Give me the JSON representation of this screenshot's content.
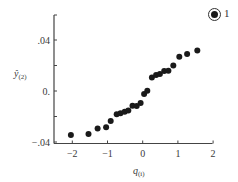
{
  "chart_data": {
    "type": "scatter",
    "title": "",
    "xlabel": "q_(i)",
    "ylabel": "ŷ_(2)",
    "xlim": [
      -2.5,
      2
    ],
    "ylim": [
      -0.04,
      0.06
    ],
    "x_ticks": [
      -2,
      -1,
      0,
      1,
      2
    ],
    "x_tick_labels": [
      "−2",
      "−1",
      "0",
      "1",
      "2"
    ],
    "y_ticks": [
      -0.04,
      -0.02,
      0,
      0.02,
      0.04
    ],
    "y_tick_labels": [
      "−.04",
      "",
      "0.",
      "",
      ".04"
    ],
    "grid": false,
    "legend": null,
    "annotation": "1",
    "series": [
      {
        "name": "residuals",
        "color": "#1a1a1a",
        "points": [
          {
            "x": -2.04,
            "y": -0.0345
          },
          {
            "x": -1.54,
            "y": -0.0337
          },
          {
            "x": -1.28,
            "y": -0.0295
          },
          {
            "x": -1.04,
            "y": -0.0285
          },
          {
            "x": -0.91,
            "y": -0.0235
          },
          {
            "x": -0.74,
            "y": -0.0183
          },
          {
            "x": -0.63,
            "y": -0.0175
          },
          {
            "x": -0.51,
            "y": -0.0162
          },
          {
            "x": -0.41,
            "y": -0.0154
          },
          {
            "x": -0.29,
            "y": -0.0115
          },
          {
            "x": -0.17,
            "y": -0.0117
          },
          {
            "x": -0.06,
            "y": -0.0094
          },
          {
            "x": 0.04,
            "y": -0.0024
          },
          {
            "x": 0.13,
            "y": 0.0002
          },
          {
            "x": 0.26,
            "y": 0.0107
          },
          {
            "x": 0.38,
            "y": 0.0125
          },
          {
            "x": 0.49,
            "y": 0.0133
          },
          {
            "x": 0.61,
            "y": 0.0157
          },
          {
            "x": 0.73,
            "y": 0.0159
          },
          {
            "x": 0.87,
            "y": 0.0201
          },
          {
            "x": 1.04,
            "y": 0.0269
          },
          {
            "x": 1.26,
            "y": 0.029
          },
          {
            "x": 1.55,
            "y": 0.0317
          }
        ]
      }
    ]
  },
  "badge": {
    "number": "1"
  }
}
